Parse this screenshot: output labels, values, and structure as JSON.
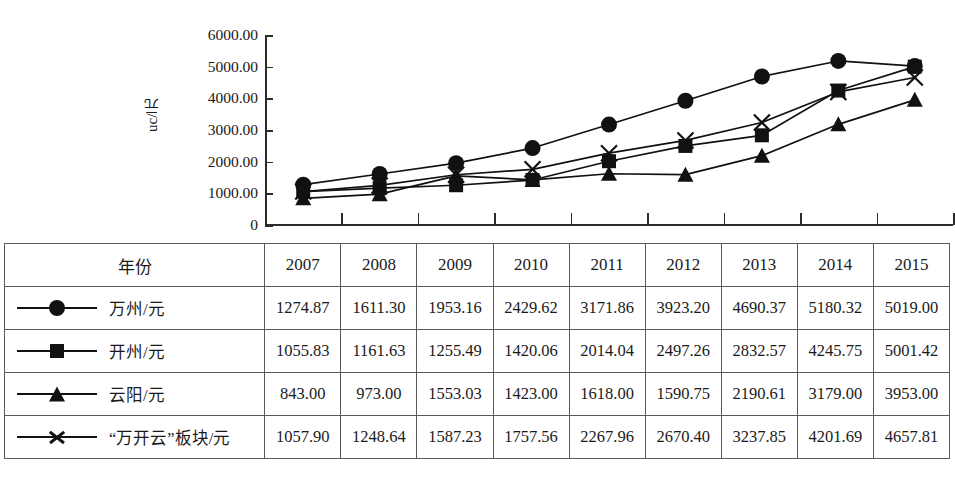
{
  "chart_data": {
    "type": "line",
    "title": "",
    "xlabel": "",
    "ylabel": "uc/元",
    "ylim": [
      0,
      6000
    ],
    "ytick_labels": [
      "6000.00",
      "5000.00",
      "4000.00",
      "3000.00",
      "2000.00",
      "1000.00",
      "0"
    ],
    "ytick_values": [
      6000,
      5000,
      4000,
      3000,
      2000,
      1000,
      0
    ],
    "grid": false,
    "legend_position": "table-below",
    "categories": [
      "2007",
      "2008",
      "2009",
      "2010",
      "2011",
      "2012",
      "2013",
      "2014",
      "2015"
    ],
    "series": [
      {
        "name": "万州/元",
        "marker": "circle",
        "values": [
          1274.87,
          1611.3,
          1953.16,
          2429.62,
          3171.86,
          3923.2,
          4690.37,
          5180.32,
          5019.0
        ],
        "labels": [
          "1274.87",
          "1611.30",
          "1953.16",
          "2429.62",
          "3171.86",
          "3923.20",
          "4690.37",
          "5180.32",
          "5019.00"
        ]
      },
      {
        "name": "开州/元",
        "marker": "square",
        "values": [
          1055.83,
          1161.63,
          1255.49,
          1420.06,
          2014.04,
          2497.26,
          2832.57,
          4245.75,
          5001.42
        ],
        "labels": [
          "1055.83",
          "1161.63",
          "1255.49",
          "1420.06",
          "2014.04",
          "2497.26",
          "2832.57",
          "4245.75",
          "5001.42"
        ]
      },
      {
        "name": "云阳/元",
        "marker": "triangle",
        "values": [
          843.0,
          973.0,
          1553.03,
          1423.0,
          1618.0,
          1590.75,
          2190.61,
          3179.0,
          3953.0
        ],
        "labels": [
          "843.00",
          "973.00",
          "1553.03",
          "1423.00",
          "1618.00",
          "1590.75",
          "2190.61",
          "3179.00",
          "3953.00"
        ]
      },
      {
        "name": "“万开云”板块/元",
        "marker": "x",
        "values": [
          1057.9,
          1248.64,
          1587.23,
          1757.56,
          2267.96,
          2670.4,
          3237.85,
          4201.69,
          4657.81
        ],
        "labels": [
          "1057.90",
          "1248.64",
          "1587.23",
          "1757.56",
          "2267.96",
          "2670.40",
          "3237.85",
          "4201.69",
          "4657.81"
        ]
      }
    ]
  },
  "table": {
    "year_header": "年份",
    "years": [
      "2007",
      "2008",
      "2009",
      "2010",
      "2011",
      "2012",
      "2013",
      "2014",
      "2015"
    ],
    "rows": [
      {
        "label": "万州/元",
        "marker": "circle",
        "values": [
          "1274.87",
          "1611.30",
          "1953.16",
          "2429.62",
          "3171.86",
          "3923.20",
          "4690.37",
          "5180.32",
          "5019.00"
        ]
      },
      {
        "label": "开州/元",
        "marker": "square",
        "values": [
          "1055.83",
          "1161.63",
          "1255.49",
          "1420.06",
          "2014.04",
          "2497.26",
          "2832.57",
          "4245.75",
          "5001.42"
        ]
      },
      {
        "label": "云阳/元",
        "marker": "triangle",
        "values": [
          "843.00",
          "973.00",
          "1553.03",
          "1423.00",
          "1618.00",
          "1590.75",
          "2190.61",
          "3179.00",
          "3953.00"
        ]
      },
      {
        "label": "“万开云”板块/元",
        "marker": "x",
        "values": [
          "1057.90",
          "1248.64",
          "1587.23",
          "1757.56",
          "2267.96",
          "2670.40",
          "3237.85",
          "4201.69",
          "4657.81"
        ]
      }
    ]
  },
  "colors": {
    "ink": "#111111",
    "rule": "#5a5a5a",
    "background": "#ffffff"
  }
}
